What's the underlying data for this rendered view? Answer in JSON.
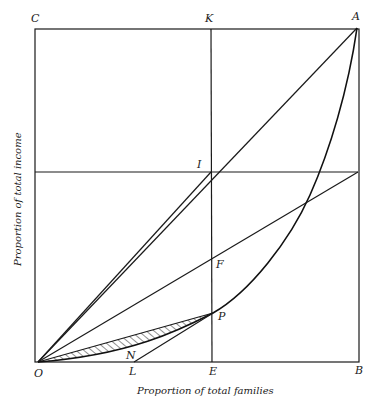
{
  "diagram": {
    "type": "lorenz-curve-geometric-diagram",
    "axes": {
      "x_label": "Proportion of total families",
      "y_label": "Proportion of total income"
    },
    "points": {
      "O": "O",
      "A": "A",
      "B": "B",
      "C": "C",
      "K": "K",
      "I": "I",
      "F": "F",
      "P": "P",
      "E": "E",
      "L": "L",
      "N": "N"
    },
    "elements": [
      "square-OCAB",
      "vertical-line-KE",
      "horizontal-line-through-I",
      "diagonal-OA",
      "line-OI",
      "line-O-to-right-edge-midpoint",
      "lorenz-curve-O-P-A",
      "chord-OP",
      "tangent-line-LP",
      "hatched-region-between-chord-OP-and-curve"
    ],
    "colors": {
      "line": "#1a1a1a",
      "background": "#ffffff"
    }
  }
}
